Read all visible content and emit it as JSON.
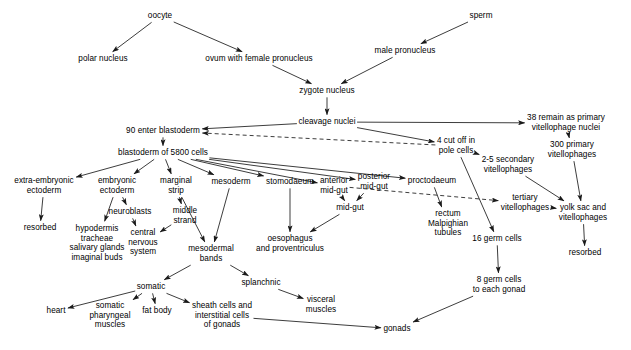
{
  "diagram": {
    "type": "flow-diagram",
    "width": 631,
    "height": 350,
    "background_color": "#ffffff",
    "line_color": "#1a1a1a",
    "text_color": "#000000",
    "nodes": [
      {
        "id": "oocyte",
        "label": "oocyte",
        "x": 160,
        "y": 16
      },
      {
        "id": "sperm",
        "label": "sperm",
        "x": 481,
        "y": 16
      },
      {
        "id": "polar_nucleus",
        "label": "polar nucleus",
        "x": 103,
        "y": 59
      },
      {
        "id": "ovum",
        "label": "ovum with female pronucleus",
        "x": 259,
        "y": 59
      },
      {
        "id": "male_pronucleus",
        "label": "male pronucleus",
        "x": 405,
        "y": 51
      },
      {
        "id": "zygote_nucleus",
        "label": "zygote nucleus",
        "x": 327,
        "y": 91
      },
      {
        "id": "cleavage_nuclei",
        "label": "cleavage nuclei",
        "x": 327,
        "y": 122
      },
      {
        "id": "primary_nuclei",
        "label": "38 remain as primary\nvitellophage nuclei",
        "x": 566,
        "y": 123
      },
      {
        "id": "pole_cells",
        "label": "4 cut off in\npole cells",
        "x": 456,
        "y": 146
      },
      {
        "id": "enter_blastoderm",
        "label": "90 enter blastoderm",
        "x": 163,
        "y": 131
      },
      {
        "id": "primary_300",
        "label": "300 primary\nvitellophages",
        "x": 572,
        "y": 150
      },
      {
        "id": "blastoderm",
        "label": "blastoderm of 5800 cells",
        "x": 163,
        "y": 153
      },
      {
        "id": "secondary_vitello",
        "label": "2-5 secondary\nvitellophages",
        "x": 508,
        "y": 165
      },
      {
        "id": "extra_embryonic",
        "label": "extra-embryonic\nectoderm",
        "x": 44,
        "y": 186
      },
      {
        "id": "embryonic_ectoderm",
        "label": "embryonic\nectoderm",
        "x": 117,
        "y": 186
      },
      {
        "id": "marginal_strip",
        "label": "marginal\nstrip",
        "x": 176,
        "y": 186
      },
      {
        "id": "mesoderm",
        "label": "mesoderm",
        "x": 231,
        "y": 182
      },
      {
        "id": "stomodaeum",
        "label": "stomodaeum",
        "x": 290,
        "y": 182
      },
      {
        "id": "anterior_midgut",
        "label": "anterior\nmid-gut",
        "x": 334,
        "y": 186
      },
      {
        "id": "posterior_midgut",
        "label": "posterior\nmid-gut",
        "x": 374,
        "y": 182
      },
      {
        "id": "proctodaeum",
        "label": "proctodaeum",
        "x": 432,
        "y": 181
      },
      {
        "id": "tertiary_vitello",
        "label": "tertiary\nvitellophages",
        "x": 525,
        "y": 203
      },
      {
        "id": "neuroblasts",
        "label": "neuroblasts",
        "x": 130,
        "y": 212
      },
      {
        "id": "middle_strand",
        "label": "middle\nstrand",
        "x": 185,
        "y": 216
      },
      {
        "id": "midgut",
        "label": "mid-gut",
        "x": 350,
        "y": 208
      },
      {
        "id": "yolk_sac",
        "label": "yolk sac and\nvitellophages",
        "x": 583,
        "y": 213
      },
      {
        "id": "resorbed_left",
        "label": "resorbed",
        "x": 40,
        "y": 228
      },
      {
        "id": "rectum",
        "label": "rectum\nMalpighian\ntubules",
        "x": 448,
        "y": 224
      },
      {
        "id": "hypodermis",
        "label": "hypodermis\ntracheae\nsalivary glands\nimaginal buds",
        "x": 97,
        "y": 243
      },
      {
        "id": "cns",
        "label": "central\nnervous\nsystem",
        "x": 143,
        "y": 243
      },
      {
        "id": "mesodermal_bands",
        "label": "mesodermal\nbands",
        "x": 211,
        "y": 254
      },
      {
        "id": "oesophagus",
        "label": "oesophagus\nand proventriculus",
        "x": 290,
        "y": 244
      },
      {
        "id": "germ_16",
        "label": "16 germ cells",
        "x": 497,
        "y": 239
      },
      {
        "id": "resorbed_right",
        "label": "resorbed",
        "x": 585,
        "y": 253
      },
      {
        "id": "somatic",
        "label": "somatic",
        "x": 151,
        "y": 287
      },
      {
        "id": "splanchnic",
        "label": "splanchnic",
        "x": 261,
        "y": 283
      },
      {
        "id": "germ_8",
        "label": "8 germ cells\nto each gonad",
        "x": 499,
        "y": 285
      },
      {
        "id": "heart",
        "label": "heart",
        "x": 56,
        "y": 311
      },
      {
        "id": "somatic_pharyngeal",
        "label": "somatic\npharyngeal\nmuscles",
        "x": 110,
        "y": 316
      },
      {
        "id": "fat_body",
        "label": "fat body",
        "x": 157,
        "y": 311
      },
      {
        "id": "sheath_cells",
        "label": "sheath cells and\ninterstitial cells\nof gonads",
        "x": 222,
        "y": 316
      },
      {
        "id": "visceral_muscles",
        "label": "visceral\nmuscles",
        "x": 321,
        "y": 305
      },
      {
        "id": "gonads",
        "label": "gonads",
        "x": 397,
        "y": 329
      }
    ],
    "edges": [
      {
        "from": "oocyte",
        "to": "polar_nucleus",
        "style": "solid"
      },
      {
        "from": "oocyte",
        "to": "ovum",
        "style": "solid"
      },
      {
        "from": "sperm",
        "to": "male_pronucleus",
        "style": "solid"
      },
      {
        "from": "ovum",
        "to": "zygote_nucleus",
        "style": "solid"
      },
      {
        "from": "male_pronucleus",
        "to": "zygote_nucleus",
        "style": "solid"
      },
      {
        "from": "zygote_nucleus",
        "to": "cleavage_nuclei",
        "style": "solid"
      },
      {
        "from": "cleavage_nuclei",
        "to": "primary_nuclei",
        "style": "solid"
      },
      {
        "from": "cleavage_nuclei",
        "to": "pole_cells",
        "style": "solid"
      },
      {
        "from": "cleavage_nuclei",
        "to": "enter_blastoderm",
        "style": "solid"
      },
      {
        "from": "pole_cells",
        "to": "enter_blastoderm",
        "style": "dashed"
      },
      {
        "from": "primary_nuclei",
        "to": "primary_300",
        "style": "solid"
      },
      {
        "from": "primary_300",
        "to": "yolk_sac",
        "style": "solid"
      },
      {
        "from": "enter_blastoderm",
        "to": "blastoderm",
        "style": "solid"
      },
      {
        "from": "blastoderm",
        "to": "extra_embryonic",
        "style": "solid"
      },
      {
        "from": "blastoderm",
        "to": "embryonic_ectoderm",
        "style": "solid"
      },
      {
        "from": "blastoderm",
        "to": "marginal_strip",
        "style": "solid"
      },
      {
        "from": "blastoderm",
        "to": "mesoderm",
        "style": "solid"
      },
      {
        "from": "blastoderm",
        "to": "stomodaeum",
        "style": "solid"
      },
      {
        "from": "blastoderm",
        "to": "anterior_midgut",
        "style": "solid"
      },
      {
        "from": "blastoderm",
        "to": "posterior_midgut",
        "style": "solid"
      },
      {
        "from": "blastoderm",
        "to": "proctodaeum",
        "style": "solid"
      },
      {
        "from": "pole_cells",
        "to": "secondary_vitello",
        "style": "solid"
      },
      {
        "from": "pole_cells",
        "to": "germ_16",
        "style": "solid"
      },
      {
        "from": "secondary_vitello",
        "to": "yolk_sac",
        "style": "solid"
      },
      {
        "from": "anterior_midgut",
        "to": "tertiary_vitello",
        "style": "dashed"
      },
      {
        "from": "tertiary_vitello",
        "to": "yolk_sac",
        "style": "solid"
      },
      {
        "from": "extra_embryonic",
        "to": "resorbed_left",
        "style": "solid"
      },
      {
        "from": "embryonic_ectoderm",
        "to": "hypodermis",
        "style": "solid"
      },
      {
        "from": "embryonic_ectoderm",
        "to": "neuroblasts",
        "style": "solid"
      },
      {
        "from": "neuroblasts",
        "to": "cns",
        "style": "solid"
      },
      {
        "from": "marginal_strip",
        "to": "middle_strand",
        "style": "solid"
      },
      {
        "from": "marginal_strip",
        "to": "mesodermal_bands",
        "style": "solid"
      },
      {
        "from": "middle_strand",
        "to": "cns",
        "style": "solid"
      },
      {
        "from": "mesoderm",
        "to": "mesodermal_bands",
        "style": "solid"
      },
      {
        "from": "stomodaeum",
        "to": "oesophagus",
        "style": "solid"
      },
      {
        "from": "anterior_midgut",
        "to": "midgut",
        "style": "solid"
      },
      {
        "from": "posterior_midgut",
        "to": "midgut",
        "style": "solid"
      },
      {
        "from": "midgut",
        "to": "oesophagus",
        "style": "solid"
      },
      {
        "from": "proctodaeum",
        "to": "rectum",
        "style": "solid"
      },
      {
        "from": "yolk_sac",
        "to": "resorbed_right",
        "style": "solid"
      },
      {
        "from": "germ_16",
        "to": "germ_8",
        "style": "solid"
      },
      {
        "from": "germ_8",
        "to": "gonads",
        "style": "solid"
      },
      {
        "from": "mesodermal_bands",
        "to": "somatic",
        "style": "solid"
      },
      {
        "from": "mesodermal_bands",
        "to": "splanchnic",
        "style": "solid"
      },
      {
        "from": "somatic",
        "to": "heart",
        "style": "solid"
      },
      {
        "from": "somatic",
        "to": "somatic_pharyngeal",
        "style": "solid"
      },
      {
        "from": "somatic",
        "to": "fat_body",
        "style": "solid"
      },
      {
        "from": "somatic",
        "to": "sheath_cells",
        "style": "solid"
      },
      {
        "from": "splanchnic",
        "to": "visceral_muscles",
        "style": "solid"
      },
      {
        "from": "sheath_cells",
        "to": "gonads",
        "style": "solid"
      }
    ]
  }
}
